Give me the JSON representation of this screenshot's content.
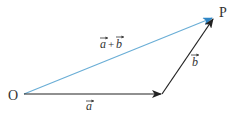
{
  "diagram": {
    "type": "vector-addition-triangle",
    "points": {
      "origin": {
        "label": "O",
        "x": 24,
        "y": 94
      },
      "mid": {
        "label": "",
        "x": 162,
        "y": 94
      },
      "end": {
        "label": "P",
        "x": 214,
        "y": 17
      }
    },
    "vectors": [
      {
        "name": "a",
        "label": "a",
        "from": "origin",
        "to": "mid",
        "color": "#222222"
      },
      {
        "name": "b",
        "label": "b",
        "from": "mid",
        "to": "end",
        "color": "#222222"
      },
      {
        "name": "a_plus_b",
        "label_a": "a",
        "label_plus": "+",
        "label_b": "b",
        "from": "origin",
        "to": "end",
        "color": "#6aaed6"
      }
    ],
    "labels": {
      "O": "O",
      "P": "P",
      "a": "a",
      "b": "b",
      "sum_a": "a",
      "sum_plus": "+",
      "sum_b": "b"
    },
    "colors": {
      "sum_line": "#6aaed6",
      "sum_arrowhead": "#2f86c6",
      "black_lines": "#222222",
      "text": "#333333"
    }
  }
}
